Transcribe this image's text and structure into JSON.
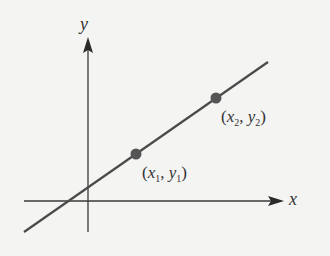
{
  "diagram": {
    "axes": {
      "x_label": "x",
      "y_label": "y"
    },
    "points": [
      {
        "name": "x",
        "sub": "1",
        "name2": "y",
        "sub2": "1"
      },
      {
        "name": "x",
        "sub": "2",
        "name2": "y",
        "sub2": "2"
      }
    ],
    "colors": {
      "line": "#4a4a4a",
      "point": "#555555",
      "background": "#f4f4f3"
    }
  }
}
